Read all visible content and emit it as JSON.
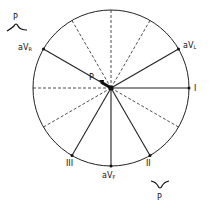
{
  "diagram": {
    "type": "hexaxial-reference-system",
    "center": {
      "x": 111,
      "y": 88
    },
    "radius": 78,
    "solid_axes": [
      {
        "name": "I",
        "angle_deg": 0,
        "label": "I"
      },
      {
        "name": "aVL",
        "angle_deg": -30,
        "label_main": "aV",
        "label_sub": "L"
      },
      {
        "name": "aVR",
        "angle_deg": -150,
        "label_main": "aV",
        "label_sub": "R"
      },
      {
        "name": "II",
        "angle_deg": 60,
        "label": "II"
      },
      {
        "name": "aVF",
        "angle_deg": 90,
        "label_main": "aV",
        "label_sub": "F"
      },
      {
        "name": "III",
        "angle_deg": 120,
        "label": "III"
      }
    ],
    "dashed_axes_deg": [
      180,
      -90,
      -60,
      -120,
      30,
      150
    ],
    "vector": {
      "label": "P",
      "direction": "toward aVR"
    },
    "waves": [
      {
        "label": "P",
        "position": "top-left",
        "shape": "upright"
      },
      {
        "label": "P",
        "position": "bottom-right",
        "shape": "inverted"
      }
    ]
  }
}
